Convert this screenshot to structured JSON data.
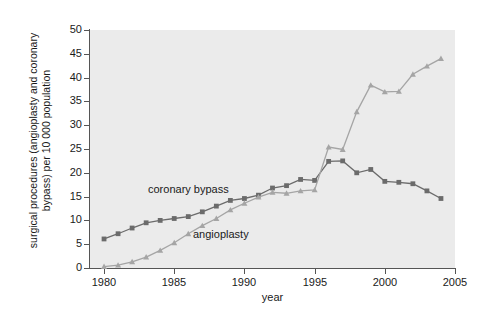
{
  "chart_data": {
    "type": "line",
    "title": "",
    "xlabel": "year",
    "ylabel": "surgical procedures (angioplasty and coronary bypass) per 10 000 population",
    "ylabel_line1": "surgical procedures (angioplasty and coronary",
    "ylabel_line2": "bypass) per 10 000 population",
    "xlim": [
      1979,
      2005
    ],
    "ylim": [
      0,
      50
    ],
    "xticks": [
      1980,
      1985,
      1990,
      1995,
      2000,
      2005
    ],
    "yticks": [
      0,
      5,
      10,
      15,
      20,
      25,
      30,
      35,
      40,
      45,
      50
    ],
    "grid": false,
    "legend_position": "inline-annotations",
    "plot_background": "#ebebeb",
    "figure_background": "#ffffff",
    "x": [
      1980,
      1981,
      1982,
      1983,
      1984,
      1985,
      1986,
      1987,
      1988,
      1989,
      1990,
      1991,
      1992,
      1993,
      1994,
      1995,
      1996,
      1997,
      1998,
      1999,
      2000,
      2001,
      2002,
      2003,
      2004
    ],
    "series": [
      {
        "name": "coronary bypass",
        "color": "#6b6b6b",
        "marker": "square",
        "values": [
          6.1,
          7.2,
          8.4,
          9.5,
          10.0,
          10.4,
          10.8,
          11.8,
          13.0,
          14.2,
          14.6,
          15.3,
          16.8,
          17.3,
          18.6,
          18.4,
          22.4,
          22.5,
          20.0,
          20.7,
          18.2,
          18.0,
          17.7,
          16.2,
          14.6
        ]
      },
      {
        "name": "angioplasty",
        "color": "#a5a5a5",
        "marker": "triangle",
        "values": [
          0.3,
          0.6,
          1.3,
          2.3,
          3.7,
          5.3,
          7.2,
          8.9,
          10.4,
          12.2,
          13.6,
          14.9,
          15.9,
          15.7,
          16.2,
          16.4,
          25.4,
          24.9,
          32.8,
          38.4,
          37.0,
          37.1,
          40.7,
          42.4,
          44.0
        ]
      }
    ]
  },
  "annotations": {
    "bypass_label": "coronary bypass",
    "angioplasty_label": "angioplasty"
  }
}
